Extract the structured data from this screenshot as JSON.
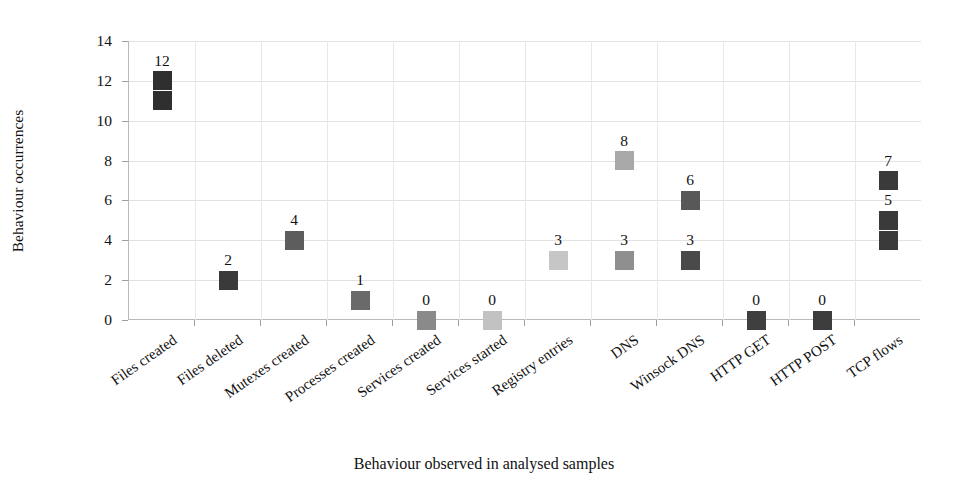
{
  "chart_data": {
    "type": "scatter",
    "title": "",
    "xlabel": "Behaviour observed in analysed samples",
    "ylabel": "Behaviour occurrences",
    "ylim": [
      0,
      14
    ],
    "y_ticks": [
      0,
      2,
      4,
      6,
      8,
      10,
      12,
      14
    ],
    "grid": true,
    "legend": "none",
    "categories": [
      "Files created",
      "Files deleted",
      "Mutexes created",
      "Processes created",
      "Services created",
      "Services started",
      "Registry entries",
      "DNS",
      "Winsock DNS",
      "HTTP GET",
      "HTTP POST",
      "TCP flows"
    ],
    "points": [
      {
        "category": "Files created",
        "value": 12,
        "label": "12",
        "color": "#2f2f2f",
        "show_label": true
      },
      {
        "category": "Files created",
        "value": 11,
        "label": "11",
        "color": "#2f2f2f",
        "show_label": false
      },
      {
        "category": "Files deleted",
        "value": 2,
        "label": "2",
        "color": "#3a3a3a",
        "show_label": true
      },
      {
        "category": "Mutexes created",
        "value": 4,
        "label": "4",
        "color": "#5d5d5d",
        "show_label": true
      },
      {
        "category": "Processes created",
        "value": 1,
        "label": "1",
        "color": "#6a6a6a",
        "show_label": true
      },
      {
        "category": "Services created",
        "value": 0,
        "label": "0",
        "color": "#8a8a8a",
        "show_label": true
      },
      {
        "category": "Services started",
        "value": 0,
        "label": "0",
        "color": "#c2c2c2",
        "show_label": true
      },
      {
        "category": "Registry entries",
        "value": 3,
        "label": "3",
        "color": "#c6c6c6",
        "show_label": true
      },
      {
        "category": "DNS",
        "value": 8,
        "label": "8",
        "color": "#a8a8a8",
        "show_label": true
      },
      {
        "category": "DNS",
        "value": 3,
        "label": "3",
        "color": "#8f8f8f",
        "show_label": true
      },
      {
        "category": "Winsock DNS",
        "value": 6,
        "label": "6",
        "color": "#585858",
        "show_label": true
      },
      {
        "category": "Winsock DNS",
        "value": 3,
        "label": "3",
        "color": "#4a4a4a",
        "show_label": true
      },
      {
        "category": "HTTP GET",
        "value": 0,
        "label": "0",
        "color": "#3f3f3f",
        "show_label": true
      },
      {
        "category": "HTTP POST",
        "value": 0,
        "label": "0",
        "color": "#3c3c3c",
        "show_label": true
      },
      {
        "category": "TCP flows",
        "value": 7,
        "label": "7",
        "color": "#3a3a3a",
        "show_label": true
      },
      {
        "category": "TCP flows",
        "value": 5,
        "label": "5",
        "color": "#3a3a3a",
        "show_label": true
      },
      {
        "category": "TCP flows",
        "value": 4,
        "label": "4",
        "color": "#3a3a3a",
        "show_label": false
      }
    ]
  },
  "axis": {
    "y_title": "Behaviour occurrences",
    "x_title": "Behaviour observed in analysed samples"
  }
}
